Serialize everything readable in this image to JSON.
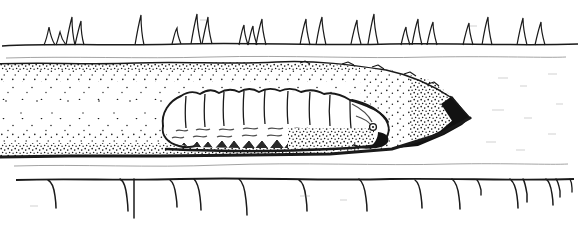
{
  "figure": {
    "medium": "pen-and-ink line drawing with stipple shading",
    "orientation": "lateral cross-section, head of larva to the right",
    "background_color": "#ffffff",
    "ink_color": "#1a1a1a",
    "stipple_color": "#1b1b1b",
    "caption": "",
    "width": 580,
    "height": 226
  },
  "layers": {
    "upper_epidermis": {
      "label": "upper leaf epidermis with trichomes",
      "baseline_y": 45,
      "stroke_width": 1.4,
      "trichomes_label": "upper-surface trichomes (hairs) pointing upward",
      "trichome_count": 22,
      "trichomes": [
        {
          "x": 48,
          "height": 18,
          "lean": 2
        },
        {
          "x": 60,
          "height": 13,
          "lean": 1
        },
        {
          "x": 70,
          "height": 28,
          "lean": -3
        },
        {
          "x": 78,
          "height": 24,
          "lean": 3
        },
        {
          "x": 140,
          "height": 30,
          "lean": -1
        },
        {
          "x": 176,
          "height": 16,
          "lean": 2
        },
        {
          "x": 196,
          "height": 30,
          "lean": -2
        },
        {
          "x": 207,
          "height": 27,
          "lean": 2
        },
        {
          "x": 243,
          "height": 20,
          "lean": 1
        },
        {
          "x": 252,
          "height": 19,
          "lean": -1
        },
        {
          "x": 261,
          "height": 26,
          "lean": 2
        },
        {
          "x": 305,
          "height": 26,
          "lean": -1
        },
        {
          "x": 321,
          "height": 28,
          "lean": 1
        },
        {
          "x": 356,
          "height": 24,
          "lean": -2
        },
        {
          "x": 373,
          "height": 30,
          "lean": 1
        },
        {
          "x": 405,
          "height": 18,
          "lean": 2
        },
        {
          "x": 417,
          "height": 26,
          "lean": -2
        },
        {
          "x": 432,
          "height": 23,
          "lean": 1
        },
        {
          "x": 468,
          "height": 22,
          "lean": -1
        },
        {
          "x": 487,
          "height": 28,
          "lean": 2
        },
        {
          "x": 522,
          "height": 27,
          "lean": -1
        },
        {
          "x": 540,
          "height": 23,
          "lean": 2
        }
      ]
    },
    "upper_inner_line": {
      "label": "faint inner membrane line beneath upper epidermis",
      "y": 58,
      "stroke_width": 0.7
    },
    "mine_cavity": {
      "label": "excavated mine chamber (stippled)",
      "top_y": 65,
      "bottom_y": 155,
      "left_x": 0,
      "tip_x": 470,
      "tip_y": 118,
      "stipple_density": "dense at margins, sparse at centre",
      "tip_note": "mine tapers to a solid black wedge at its right-hand end"
    },
    "lower_epidermis": {
      "label": "lower leaf epidermis with trichomes",
      "baseline_y": 180,
      "stroke_width": 1.6,
      "trichomes_label": "lower-surface trichomes (hairs) pointing downward",
      "trichome_count": 16,
      "trichomes": [
        {
          "x": 55,
          "depth": 28
        },
        {
          "x": 126,
          "depth": 30
        },
        {
          "x": 131,
          "depth": 38
        },
        {
          "x": 175,
          "depth": 26
        },
        {
          "x": 199,
          "depth": 30
        },
        {
          "x": 245,
          "depth": 36
        },
        {
          "x": 305,
          "depth": 30
        },
        {
          "x": 365,
          "depth": 30
        },
        {
          "x": 420,
          "depth": 27
        },
        {
          "x": 458,
          "depth": 29
        },
        {
          "x": 480,
          "depth": 15
        },
        {
          "x": 516,
          "depth": 28
        },
        {
          "x": 524,
          "depth": 22
        },
        {
          "x": 551,
          "depth": 25
        },
        {
          "x": 556,
          "depth": 18
        },
        {
          "x": 570,
          "depth": 12
        }
      ]
    },
    "lower_inner_line": {
      "label": "faint inner membrane line above lower epidermis",
      "y": 166,
      "stroke_width": 0.7
    }
  },
  "larva": {
    "label": "leaf-mining larva (caterpillar)",
    "posture": "resting in mine, head to the right",
    "body_left_x": 162,
    "body_right_x": 390,
    "dorsal_y": 93,
    "ventral_y": 146,
    "segment_count": 9,
    "segment_divisions_x": [
      186,
      205,
      224,
      244,
      265,
      288,
      310,
      330,
      350
    ],
    "lateral_wavy_lines_label": "wavy lateral folds along the flank",
    "lateral_wavy_line_rows": 2,
    "prolegs_label": "ventral prolegs and crumpled frass granules along the belly",
    "head": {
      "label": "head capsule",
      "x": 372,
      "y": 122,
      "eye_label": "stemma (simple eye)",
      "eye_x": 373,
      "eye_y": 126,
      "eye_r": 3,
      "mandible_label": "dark mandible / mouthparts",
      "mandible_note": "solid black wedge at lower right of head"
    }
  },
  "annotations": []
}
